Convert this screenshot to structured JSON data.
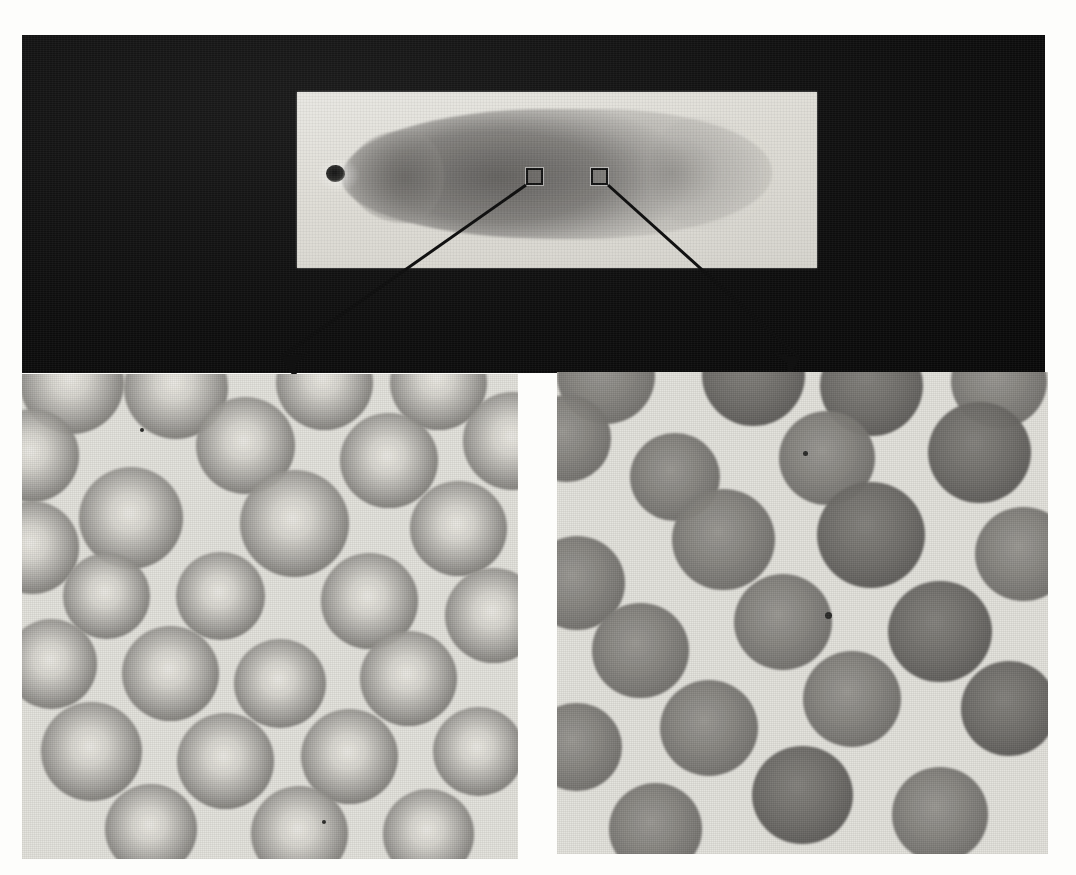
{
  "figure": {
    "type": "microscopy-plate",
    "background_color": "#fdfdfb",
    "dark_field_color": "#0d0d0d",
    "slide_color": "#e2e0d9",
    "ink_color": "#111111"
  },
  "top_photo": {
    "name": "slide-photograph",
    "description": "Stained peripheral blood smear on a glass microscope slide photographed against a black background",
    "dark_background": {
      "x": 22,
      "y": 35,
      "width": 1023,
      "height": 338
    },
    "slide": {
      "x": 275,
      "y": 57,
      "width": 520,
      "height": 176,
      "description": "Glass microscope slide bearing a horizontally drawn blood film"
    },
    "smear": {
      "description": "Elongated blood film with dense head at the left, body across the centre and a feathered tail edge at the right",
      "artifact_spot": "dark staining artifact near the left head of the smear"
    },
    "roi_markers": [
      {
        "label": "left-roi",
        "x": 504,
        "y": 133,
        "size": 17,
        "points_to": "panel-left"
      },
      {
        "label": "right-roi",
        "x": 569,
        "y": 133,
        "size": 17,
        "points_to": "panel-right"
      }
    ],
    "leaders": [
      {
        "label": "left-leader",
        "from_x": 504,
        "from_y": 150,
        "to_x": 267,
        "to_y": 363
      },
      {
        "label": "right-leader",
        "from_x": 586,
        "from_y": 150,
        "to_x": 790,
        "to_y": 365
      }
    ]
  },
  "panels": [
    {
      "id": "panel-left",
      "name": "micrograph-panel-left",
      "x": 22,
      "y": 374,
      "width": 496,
      "height": 485,
      "description": "High magnification field from the thinner region of the smear",
      "finding": "Red cells show a distinct bright central pallor, indicating normal biconcave discs spread in a monolayer",
      "cell_appearance": "pallor",
      "cell_count_visible": 23
    },
    {
      "id": "panel-right",
      "name": "micrograph-panel-right",
      "x": 557,
      "y": 372,
      "width": 491,
      "height": 482,
      "description": "High magnification field from the thicker region of the smear",
      "finding": "Red cells appear uniformly dense and crowded with little or no central pallor, an artifact of the thicker film",
      "cell_appearance": "dense",
      "cell_count_visible": 19
    }
  ],
  "left_panel_cells": [
    {
      "cx": 0.1,
      "cy": 0.02,
      "r": 0.105,
      "tone": "pallor"
    },
    {
      "cx": 0.31,
      "cy": 0.03,
      "r": 0.105,
      "tone": "pallor"
    },
    {
      "cx": 0.61,
      "cy": 0.02,
      "r": 0.098,
      "tone": "pallor"
    },
    {
      "cx": 0.84,
      "cy": 0.02,
      "r": 0.098,
      "tone": "pallor"
    },
    {
      "cx": 0.02,
      "cy": 0.17,
      "r": 0.095,
      "tone": "pallor"
    },
    {
      "cx": 0.99,
      "cy": 0.14,
      "r": 0.1,
      "tone": "pallor"
    },
    {
      "cx": 0.45,
      "cy": 0.15,
      "r": 0.1,
      "tone": "pallor"
    },
    {
      "cx": 0.74,
      "cy": 0.18,
      "r": 0.098,
      "tone": "pallor"
    },
    {
      "cx": 0.22,
      "cy": 0.3,
      "r": 0.105,
      "tone": "pallor"
    },
    {
      "cx": 0.55,
      "cy": 0.31,
      "r": 0.11,
      "tone": "pallor"
    },
    {
      "cx": 0.88,
      "cy": 0.32,
      "r": 0.098,
      "tone": "pallor"
    },
    {
      "cx": 0.02,
      "cy": 0.36,
      "r": 0.095,
      "tone": "pallor"
    },
    {
      "cx": 0.17,
      "cy": 0.46,
      "r": 0.088,
      "tone": "pallor"
    },
    {
      "cx": 0.4,
      "cy": 0.46,
      "r": 0.09,
      "tone": "pallor"
    },
    {
      "cx": 0.7,
      "cy": 0.47,
      "r": 0.098,
      "tone": "pallor"
    },
    {
      "cx": 0.95,
      "cy": 0.5,
      "r": 0.098,
      "tone": "pallor"
    },
    {
      "cx": 0.06,
      "cy": 0.6,
      "r": 0.092,
      "tone": "pallor"
    },
    {
      "cx": 0.3,
      "cy": 0.62,
      "r": 0.098,
      "tone": "pallor"
    },
    {
      "cx": 0.52,
      "cy": 0.64,
      "r": 0.092,
      "tone": "pallor"
    },
    {
      "cx": 0.78,
      "cy": 0.63,
      "r": 0.098,
      "tone": "pallor"
    },
    {
      "cx": 0.14,
      "cy": 0.78,
      "r": 0.102,
      "tone": "pallor"
    },
    {
      "cx": 0.41,
      "cy": 0.8,
      "r": 0.098,
      "tone": "pallor"
    },
    {
      "cx": 0.66,
      "cy": 0.79,
      "r": 0.098,
      "tone": "pallor"
    },
    {
      "cx": 0.92,
      "cy": 0.78,
      "r": 0.092,
      "tone": "pallor"
    },
    {
      "cx": 0.26,
      "cy": 0.94,
      "r": 0.092,
      "tone": "pallor"
    },
    {
      "cx": 0.56,
      "cy": 0.95,
      "r": 0.098,
      "tone": "pallor"
    },
    {
      "cx": 0.82,
      "cy": 0.95,
      "r": 0.092,
      "tone": "pallor"
    }
  ],
  "right_panel_cells": [
    {
      "cx": 0.1,
      "cy": 0.01,
      "r": 0.1,
      "tone": "dense"
    },
    {
      "cx": 0.4,
      "cy": 0.01,
      "r": 0.105,
      "tone": "dense-dark"
    },
    {
      "cx": 0.64,
      "cy": 0.03,
      "r": 0.105,
      "tone": "dense-dark"
    },
    {
      "cx": 0.9,
      "cy": 0.02,
      "r": 0.098,
      "tone": "dense"
    },
    {
      "cx": 0.02,
      "cy": 0.14,
      "r": 0.09,
      "tone": "dense"
    },
    {
      "cx": 0.86,
      "cy": 0.17,
      "r": 0.105,
      "tone": "dense-dark"
    },
    {
      "cx": 0.55,
      "cy": 0.18,
      "r": 0.098,
      "tone": "dense"
    },
    {
      "cx": 0.24,
      "cy": 0.22,
      "r": 0.092,
      "tone": "dense"
    },
    {
      "cx": 0.34,
      "cy": 0.35,
      "r": 0.105,
      "tone": "dense"
    },
    {
      "cx": 0.64,
      "cy": 0.34,
      "r": 0.11,
      "tone": "dense-dark"
    },
    {
      "cx": 0.95,
      "cy": 0.38,
      "r": 0.098,
      "tone": "dense"
    },
    {
      "cx": 0.04,
      "cy": 0.44,
      "r": 0.098,
      "tone": "dense"
    },
    {
      "cx": 0.46,
      "cy": 0.52,
      "r": 0.1,
      "tone": "dense"
    },
    {
      "cx": 0.78,
      "cy": 0.54,
      "r": 0.105,
      "tone": "dense-dark"
    },
    {
      "cx": 0.17,
      "cy": 0.58,
      "r": 0.098,
      "tone": "dense"
    },
    {
      "cx": 0.6,
      "cy": 0.68,
      "r": 0.1,
      "tone": "dense"
    },
    {
      "cx": 0.92,
      "cy": 0.7,
      "r": 0.098,
      "tone": "dense-dark"
    },
    {
      "cx": 0.31,
      "cy": 0.74,
      "r": 0.1,
      "tone": "dense"
    },
    {
      "cx": 0.04,
      "cy": 0.78,
      "r": 0.092,
      "tone": "dense"
    },
    {
      "cx": 0.5,
      "cy": 0.88,
      "r": 0.102,
      "tone": "dense-dark"
    },
    {
      "cx": 0.78,
      "cy": 0.92,
      "r": 0.098,
      "tone": "dense"
    },
    {
      "cx": 0.2,
      "cy": 0.95,
      "r": 0.095,
      "tone": "dense"
    }
  ]
}
